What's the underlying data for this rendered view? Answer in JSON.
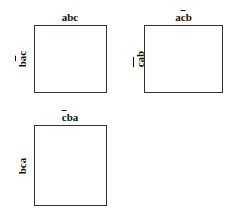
{
  "panels": [
    {
      "top_label": {
        "pre": "abc",
        "bar": "",
        "post": ""
      },
      "side_label": {
        "pre": "b",
        "bar": "a",
        "post": "c"
      }
    },
    {
      "top_label": {
        "pre": "a",
        "bar": "c",
        "post": "b"
      },
      "side_label": {
        "pre": "",
        "bar": "ca",
        "post": "b"
      }
    },
    {
      "top_label": {
        "pre": "",
        "bar": "c",
        "post": "ba"
      },
      "side_label": {
        "pre": "bca",
        "bar": "",
        "post": ""
      }
    }
  ]
}
